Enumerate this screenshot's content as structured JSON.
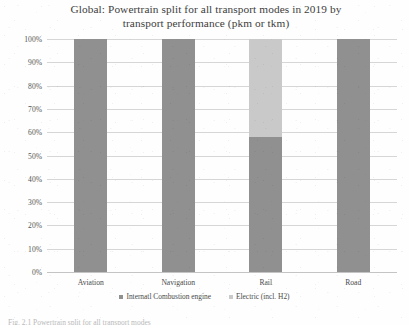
{
  "chart_data": {
    "type": "bar",
    "subtype": "stacked-100",
    "title": "Global: Powertrain split for all transport modes in 2019 by transport performance (pkm or tkm)",
    "title_line1": "Global: Powertrain split for all transport modes in 2019 by",
    "title_line2": "transport performance (pkm or tkm)",
    "xlabel": "",
    "ylabel": "",
    "categories": [
      "Aviation",
      "Navigation",
      "Rail",
      "Road"
    ],
    "series": [
      {
        "name": "Internatl Combustion engine",
        "color": "#909090",
        "values": [
          100,
          100,
          58,
          100
        ]
      },
      {
        "name": "Electric (incl. H2)",
        "color": "#c9c9c9",
        "values": [
          0,
          0,
          42,
          0
        ]
      }
    ],
    "ylim": [
      0,
      100
    ],
    "ytick_values": [
      0,
      10,
      20,
      30,
      40,
      50,
      60,
      70,
      80,
      90,
      100
    ],
    "ytick_labels": [
      "0%",
      "10%",
      "20%",
      "30%",
      "40%",
      "50%",
      "60%",
      "70%",
      "80%",
      "90%",
      "100%"
    ],
    "grid": true,
    "grid_axis": "y",
    "legend_position": "bottom",
    "value_unit": "%"
  },
  "legend": {
    "items": [
      {
        "label": "Internatl Combustion engine",
        "color": "#909090"
      },
      {
        "label": "Electric (incl. H2)",
        "color": "#c9c9c9"
      }
    ]
  },
  "bottom_caption": "Fig. 2.1 Powertrain split for all transport modes"
}
